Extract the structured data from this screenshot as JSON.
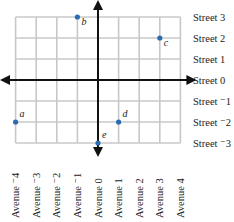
{
  "diagram": {
    "title": "",
    "streets": [
      {
        "value": 3,
        "label": "Street 3"
      },
      {
        "value": 2,
        "label": "Street 2"
      },
      {
        "value": 1,
        "label": "Street 1"
      },
      {
        "value": 0,
        "label": "Street 0"
      },
      {
        "value": -1,
        "label": "Street ⁻1"
      },
      {
        "value": -2,
        "label": "Street ⁻2"
      },
      {
        "value": -3,
        "label": "Street ⁻3"
      }
    ],
    "avenues": [
      {
        "value": -4,
        "label": "Avenue ⁻4"
      },
      {
        "value": -3,
        "label": "Avenue ⁻3"
      },
      {
        "value": -2,
        "label": "Avenue ⁻2"
      },
      {
        "value": -1,
        "label": "Avenue ⁻1"
      },
      {
        "value": 0,
        "label": "Avenue 0"
      },
      {
        "value": 1,
        "label": "Avenue 1"
      },
      {
        "value": 2,
        "label": "Avenue 2"
      },
      {
        "value": 3,
        "label": "Avenue 3"
      },
      {
        "value": 4,
        "label": "Avenue 4"
      }
    ],
    "points": [
      {
        "name": "a",
        "avenue": -4,
        "street": -2
      },
      {
        "name": "b",
        "avenue": -1,
        "street": 3
      },
      {
        "name": "c",
        "avenue": 3,
        "street": 2
      },
      {
        "name": "d",
        "avenue": 1,
        "street": -2
      },
      {
        "name": "e",
        "avenue": 0,
        "street": -3
      }
    ],
    "colors": {
      "grid": "#c8c8c8",
      "axis": "#111111",
      "point": "#2b6cb0"
    }
  }
}
